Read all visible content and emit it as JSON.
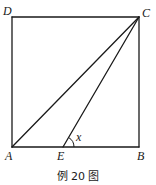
{
  "diagram": {
    "type": "geometry",
    "points": {
      "A": {
        "label": "A",
        "x": 12,
        "y": 147
      },
      "B": {
        "label": "B",
        "x": 139,
        "y": 147
      },
      "C": {
        "label": "C",
        "x": 139,
        "y": 17
      },
      "D": {
        "label": "D",
        "x": 12,
        "y": 17
      },
      "E": {
        "label": "E",
        "x": 63,
        "y": 147
      }
    },
    "segments": [
      [
        "A",
        "B"
      ],
      [
        "B",
        "C"
      ],
      [
        "C",
        "D"
      ],
      [
        "D",
        "A"
      ],
      [
        "A",
        "C"
      ],
      [
        "E",
        "C"
      ]
    ],
    "angle_marks": [
      {
        "vertex": "E",
        "from": "B",
        "to": "C",
        "label": "x"
      }
    ],
    "labels": {
      "A": "A",
      "B": "B",
      "C": "C",
      "D": "D",
      "E": "E",
      "angle": "x"
    },
    "caption": "例 20 图",
    "colors": {
      "stroke": "#1a1a1a",
      "background": "#ffffff"
    }
  }
}
